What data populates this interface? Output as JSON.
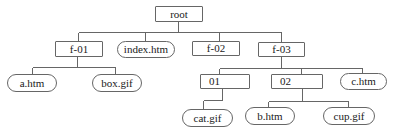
{
  "diagram": {
    "type": "tree",
    "canvas": {
      "w": 395,
      "h": 133
    },
    "colors": {
      "background": "#ffffff",
      "line": "#666666",
      "node_border": "#666666",
      "node_fill": "#ffffff",
      "text": "#1a1a1a"
    },
    "nodes": [
      {
        "id": "root",
        "label": "root",
        "shape": "rect",
        "x": 155,
        "y": 6,
        "w": 48,
        "h": 16
      },
      {
        "id": "f-01",
        "label": "f-01",
        "shape": "rect",
        "x": 55,
        "y": 41,
        "w": 48,
        "h": 16
      },
      {
        "id": "index-htm",
        "label": "index.htm",
        "shape": "pill",
        "x": 117,
        "y": 41,
        "w": 58,
        "h": 17
      },
      {
        "id": "f-02",
        "label": "f-02",
        "shape": "rect",
        "x": 192,
        "y": 41,
        "w": 48,
        "h": 15
      },
      {
        "id": "f-03",
        "label": "f-03",
        "shape": "rect",
        "x": 258,
        "y": 42,
        "w": 47,
        "h": 15
      },
      {
        "id": "a-htm",
        "label": "a.htm",
        "shape": "pill",
        "x": 7,
        "y": 74,
        "w": 50,
        "h": 18
      },
      {
        "id": "box-gif",
        "label": "box.gif",
        "shape": "pill",
        "x": 92,
        "y": 74,
        "w": 50,
        "h": 18
      },
      {
        "id": "01",
        "label": "01",
        "shape": "rect",
        "x": 200,
        "y": 74,
        "w": 50,
        "h": 15,
        "align": "left"
      },
      {
        "id": "02",
        "label": "02",
        "shape": "rect",
        "x": 271,
        "y": 74,
        "w": 52,
        "h": 15,
        "align": "left"
      },
      {
        "id": "c-htm",
        "label": "c.htm",
        "shape": "pill",
        "x": 340,
        "y": 73,
        "w": 47,
        "h": 17
      },
      {
        "id": "cat-gif",
        "label": "cat.gif",
        "shape": "pill",
        "x": 182,
        "y": 109,
        "w": 51,
        "h": 18
      },
      {
        "id": "b-htm",
        "label": "b.htm",
        "shape": "pill",
        "x": 245,
        "y": 107,
        "w": 50,
        "h": 18
      },
      {
        "id": "cup-gif",
        "label": "cup.gif",
        "shape": "pill",
        "x": 323,
        "y": 107,
        "w": 52,
        "h": 18
      }
    ],
    "edges": [
      {
        "parent": "root",
        "children": [
          "f-01",
          "index.htm",
          "f-02",
          "f-03"
        ]
      },
      {
        "parent": "f-01",
        "children": [
          "a.htm",
          "box.gif"
        ]
      },
      {
        "parent": "f-03",
        "children": [
          "01",
          "02",
          "c.htm"
        ]
      },
      {
        "parent": "01",
        "children": [
          "cat.gif"
        ]
      },
      {
        "parent": "02",
        "children": [
          "b.htm",
          "cup.gif"
        ]
      }
    ],
    "connectors": [
      {
        "parent": "root",
        "parent_x": 178,
        "parent_bottom": 22,
        "bus_y": 32,
        "drops": [
          {
            "x": 78,
            "top": 41
          },
          {
            "x": 145,
            "top": 41
          },
          {
            "x": 219,
            "top": 41
          },
          {
            "x": 281,
            "top": 42
          }
        ]
      },
      {
        "parent": "f-01",
        "parent_x": 77,
        "parent_bottom": 57,
        "bus_y": 67,
        "drops": [
          {
            "x": 32,
            "top": 74
          },
          {
            "x": 115,
            "top": 74
          }
        ]
      },
      {
        "parent": "f-03",
        "parent_x": 281,
        "parent_bottom": 57,
        "bus_y": 68,
        "drops": [
          {
            "x": 219,
            "top": 74
          },
          {
            "x": 301,
            "top": 74
          },
          {
            "x": 362,
            "top": 73
          }
        ]
      },
      {
        "parent": "01",
        "parent_x": 222,
        "parent_bottom": 89,
        "bus_y": 100,
        "drops": [
          {
            "x": 203,
            "top": 109
          }
        ]
      },
      {
        "parent": "02",
        "parent_x": 302,
        "parent_bottom": 89,
        "bus_y": 101,
        "drops": [
          {
            "x": 268,
            "top": 107
          },
          {
            "x": 348,
            "top": 107
          }
        ]
      }
    ]
  }
}
